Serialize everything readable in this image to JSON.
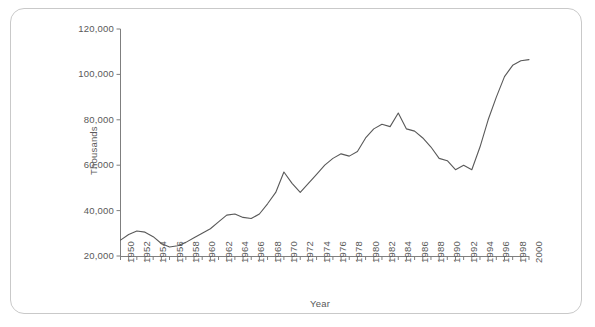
{
  "chart_data": {
    "type": "line",
    "title": "",
    "xlabel": "Year",
    "ylabel": "Thousands",
    "xlim": [
      1950,
      2000
    ],
    "ylim": [
      20000,
      120000
    ],
    "grid": false,
    "legend": null,
    "y_ticks": [
      "20,000",
      "40,000",
      "60,000",
      "80,000",
      "100,000",
      "120,000"
    ],
    "y_tick_values": [
      20000,
      40000,
      60000,
      80000,
      100000,
      120000
    ],
    "x_tick_labels": [
      "1950",
      "1952",
      "1954",
      "1956",
      "1958",
      "1960",
      "1962",
      "1964",
      "1966",
      "1968",
      "1970",
      "1972",
      "1974",
      "1976",
      "1978",
      "1980",
      "1982",
      "1984",
      "1986",
      "1988",
      "1990",
      "1992",
      "1994",
      "1996",
      "1998",
      "2000"
    ],
    "x": [
      1950,
      1951,
      1952,
      1953,
      1954,
      1955,
      1956,
      1957,
      1958,
      1959,
      1960,
      1961,
      1962,
      1963,
      1964,
      1965,
      1966,
      1967,
      1968,
      1969,
      1970,
      1971,
      1972,
      1973,
      1974,
      1975,
      1976,
      1977,
      1978,
      1979,
      1980,
      1981,
      1982,
      1983,
      1984,
      1985,
      1986,
      1987,
      1988,
      1989,
      1990,
      1991,
      1992,
      1993,
      1994,
      1995,
      1996,
      1997,
      1998,
      1999,
      2000
    ],
    "values": [
      27000,
      29500,
      31000,
      30500,
      28500,
      25500,
      24000,
      24500,
      26000,
      28000,
      30000,
      32000,
      35000,
      38000,
      38500,
      37000,
      36500,
      38500,
      43000,
      48000,
      57000,
      52000,
      48000,
      52000,
      56000,
      60000,
      63000,
      65000,
      64000,
      66000,
      72000,
      76000,
      78000,
      77000,
      83000,
      76000,
      75000,
      72000,
      68000,
      63000,
      62000,
      58000,
      60000,
      58000,
      68000,
      80000,
      90000,
      99000,
      104000,
      106000,
      106500
    ],
    "line_color": "#595959",
    "axis_color": "#7f7f7f",
    "text_color": "#595959"
  }
}
